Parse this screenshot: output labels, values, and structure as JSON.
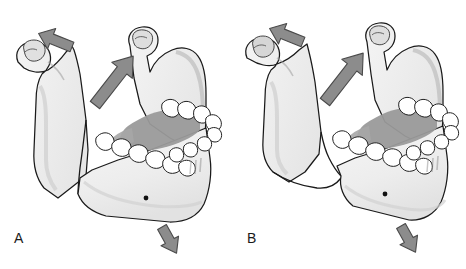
{
  "figure": {
    "background_color": "#ffffff",
    "width": 466,
    "height": 269
  },
  "palette": {
    "bone_fill": "#efefef",
    "bone_fill_light": "#f7f7f7",
    "bone_shadow": "#d8d8d8",
    "bone_shadow_deep": "#b9b9b9",
    "outline": "#1a1a1a",
    "tooth_fill": "#ffffff",
    "tooth_outline": "#222222",
    "tongue_shade": "#9a9a9a",
    "tongue_shade_dark": "#8a8a8a",
    "arrow_fill": "#8c8c8c",
    "arrow_outline": "#4a4a4a",
    "label_color": "#1a1a1a",
    "foramen_color": "#111111"
  },
  "panels": [
    {
      "id": "a",
      "label": "A",
      "caption": "Favorable fracture of the mandibular angle",
      "fracture": {
        "name": "vertically-favorable-fracture-line",
        "description": "Near-vertical fracture line through the mandibular body running downward from the alveolar ridge"
      },
      "arrows": [
        {
          "name": "superior-displacement-arrow",
          "label": "upward pull of elevator muscles on proximal segment",
          "direction": "up-left",
          "angle_deg": -68
        },
        {
          "name": "masseter-pull-arrow",
          "label": "superior-anterior pull along the ramus",
          "direction": "up-right",
          "angle_deg": -52
        },
        {
          "name": "inferior-displacement-arrow",
          "label": "downward-backward pull of depressor muscles on distal segment",
          "direction": "down-left",
          "angle_deg": 128
        }
      ],
      "landmarks": [
        {
          "name": "condyle",
          "label": "Condylar head"
        },
        {
          "name": "coronoid-process",
          "label": "Coronoid process"
        },
        {
          "name": "sigmoid-notch",
          "label": "Sigmoid notch"
        },
        {
          "name": "ramus",
          "label": "Ramus"
        },
        {
          "name": "mandibular-angle",
          "label": "Angle of mandible"
        },
        {
          "name": "mental-foramen",
          "label": "Mental foramen"
        },
        {
          "name": "dental-arch",
          "label": "Dental arch"
        }
      ]
    },
    {
      "id": "b",
      "label": "B",
      "caption": "Unfavorable fracture of the mandibular angle with displacement",
      "fracture": {
        "name": "oblique-unfavorable-fracture-line",
        "description": "Oblique fracture line with overriding displaced proximal segment"
      },
      "arrows": [
        {
          "name": "superior-displacement-arrow",
          "label": "upward pull of elevator muscles on proximal segment",
          "direction": "up-left",
          "angle_deg": -68
        },
        {
          "name": "masseter-pull-arrow",
          "label": "superior-anterior pull along the ramus",
          "direction": "up-right",
          "angle_deg": -52
        },
        {
          "name": "inferior-displacement-arrow",
          "label": "downward-backward pull of depressor muscles on distal segment",
          "direction": "down-left",
          "angle_deg": 128
        }
      ],
      "landmarks": [
        {
          "name": "condyle",
          "label": "Condylar head"
        },
        {
          "name": "coronoid-process",
          "label": "Coronoid process"
        },
        {
          "name": "sigmoid-notch",
          "label": "Sigmoid notch"
        },
        {
          "name": "ramus",
          "label": "Ramus"
        },
        {
          "name": "mandibular-angle",
          "label": "Angle of mandible"
        },
        {
          "name": "mental-foramen",
          "label": "Mental foramen"
        },
        {
          "name": "dental-arch",
          "label": "Dental arch"
        }
      ]
    }
  ]
}
